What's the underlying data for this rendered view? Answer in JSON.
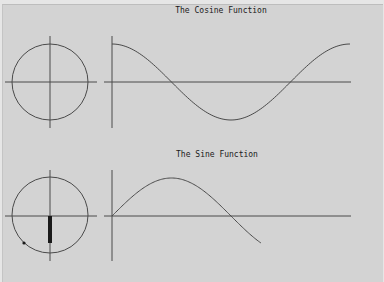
{
  "colors": {
    "background": "#d3d3d3",
    "line": "#4a4a4a",
    "marker": "#1a1a1a"
  },
  "chart_data": [
    {
      "type": "line",
      "title": "The Cosine Function",
      "xlabel": "",
      "ylabel": "",
      "grid": false,
      "legend": null,
      "function": "cos(x)",
      "x_range": [
        0,
        6.283
      ],
      "ylim": [
        -1,
        1
      ],
      "x": [
        0,
        0.785,
        1.571,
        2.356,
        3.142,
        3.927,
        4.712,
        5.498,
        6.283
      ],
      "values": [
        1,
        0.707,
        0,
        -0.707,
        -1,
        -0.707,
        0,
        0.707,
        1
      ],
      "unit_circle": {
        "shown": true
      }
    },
    {
      "type": "line",
      "title": "The Sine Function",
      "xlabel": "",
      "ylabel": "",
      "grid": false,
      "legend": null,
      "function": "sin(x)",
      "x_range": [
        0,
        3.93
      ],
      "ylim": [
        -1,
        1
      ],
      "x": [
        0,
        0.785,
        1.571,
        2.356,
        3.142,
        3.93
      ],
      "values": [
        0,
        0.707,
        1,
        0.707,
        0,
        -0.71
      ],
      "unit_circle": {
        "shown": true,
        "point_angle_rad": 3.93,
        "sine_bar_value": -0.71
      }
    }
  ]
}
